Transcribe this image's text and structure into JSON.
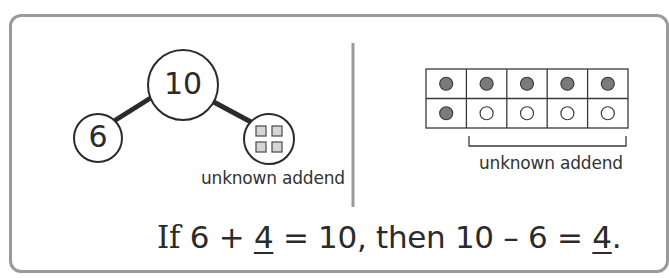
{
  "number_bond": {
    "whole": "10",
    "known_part": "6",
    "unknown_part_label": "unknown addend",
    "unknown_part_icon": "four-squares-icon"
  },
  "ten_frame": {
    "rows": 2,
    "cols": 5,
    "cells": [
      [
        "filled",
        "filled",
        "filled",
        "filled",
        "filled"
      ],
      [
        "filled",
        "empty",
        "empty",
        "empty",
        "empty"
      ]
    ],
    "bracket_label": "unknown addend",
    "colors": {
      "filled": "#7a7a7a",
      "empty": "#ffffff",
      "grid": "#3a3a3a"
    }
  },
  "equation": {
    "prefix": "If",
    "part1": " 6 + ",
    "answer1": "4",
    "part2": " = 10, then 10 – 6 = ",
    "answer2": "4",
    "suffix": "."
  },
  "colors": {
    "frame_border": "#9a9a9a",
    "divider": "#9a9a9a",
    "ink": "#2b2b2b"
  }
}
